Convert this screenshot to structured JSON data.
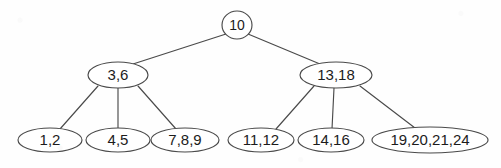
{
  "diagram": {
    "kind": "multiway-search-tree",
    "title": "",
    "stroke_color": "#4a4a4a",
    "node_fill": "#ffffff",
    "text_color": "#1c1c1c",
    "background_color": "#fefefe",
    "nodes": [
      {
        "id": "root",
        "label": "10",
        "shape": "circle",
        "cx": 237,
        "cy": 25,
        "rx": 15,
        "ry": 14,
        "level": 0
      },
      {
        "id": "internal-left",
        "label": "3,6",
        "shape": "ellipse",
        "cx": 118,
        "cy": 75,
        "rx": 30,
        "ry": 13,
        "level": 1
      },
      {
        "id": "internal-right",
        "label": "13,18",
        "shape": "ellipse",
        "cx": 336,
        "cy": 75,
        "rx": 36,
        "ry": 13,
        "level": 1
      },
      {
        "id": "leaf-1",
        "label": "1,2",
        "shape": "ellipse",
        "cx": 50,
        "cy": 140,
        "rx": 32,
        "ry": 12,
        "level": 2
      },
      {
        "id": "leaf-2",
        "label": "4,5",
        "shape": "ellipse",
        "cx": 118,
        "cy": 140,
        "rx": 32,
        "ry": 12,
        "level": 2
      },
      {
        "id": "leaf-3",
        "label": "7,8,9",
        "shape": "ellipse",
        "cx": 185,
        "cy": 140,
        "rx": 34,
        "ry": 12,
        "level": 2
      },
      {
        "id": "leaf-4",
        "label": "11,12",
        "shape": "ellipse",
        "cx": 261,
        "cy": 140,
        "rx": 33,
        "ry": 12,
        "level": 2
      },
      {
        "id": "leaf-5",
        "label": "14,16",
        "shape": "ellipse",
        "cx": 331,
        "cy": 140,
        "rx": 33,
        "ry": 12,
        "level": 2
      },
      {
        "id": "leaf-6",
        "label": "19,20,21,24",
        "shape": "ellipse",
        "cx": 430,
        "cy": 140,
        "rx": 58,
        "ry": 13,
        "level": 2
      }
    ],
    "edges": [
      {
        "id": "edge-root-left",
        "from": "root",
        "to": "internal-left",
        "x1": 226,
        "y1": 34,
        "x2": 133,
        "y2": 64
      },
      {
        "id": "edge-root-right",
        "from": "root",
        "to": "internal-right",
        "x1": 248,
        "y1": 34,
        "x2": 320,
        "y2": 64
      },
      {
        "id": "edge-left-1",
        "from": "internal-left",
        "to": "leaf-1",
        "x1": 98,
        "y1": 86,
        "x2": 60,
        "y2": 129
      },
      {
        "id": "edge-left-2",
        "from": "internal-left",
        "to": "leaf-2",
        "x1": 118,
        "y1": 88,
        "x2": 118,
        "y2": 129
      },
      {
        "id": "edge-left-3",
        "from": "internal-left",
        "to": "leaf-3",
        "x1": 138,
        "y1": 86,
        "x2": 176,
        "y2": 129
      },
      {
        "id": "edge-right-1",
        "from": "internal-right",
        "to": "leaf-4",
        "x1": 314,
        "y1": 86,
        "x2": 276,
        "y2": 129
      },
      {
        "id": "edge-right-2",
        "from": "internal-right",
        "to": "leaf-5",
        "x1": 334,
        "y1": 88,
        "x2": 332,
        "y2": 129
      },
      {
        "id": "edge-right-3",
        "from": "internal-right",
        "to": "leaf-6",
        "x1": 360,
        "y1": 86,
        "x2": 415,
        "y2": 128
      }
    ]
  }
}
